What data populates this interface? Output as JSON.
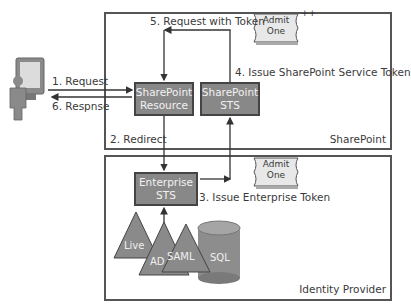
{
  "diagram": {
    "zones": {
      "sharepoint": "SharePoint",
      "identity_provider": "Identity Provider"
    },
    "nodes": {
      "sharepoint_resource": [
        "SharePoint",
        "Resource"
      ],
      "sharepoint_sts": [
        "SharePoint",
        "STS"
      ],
      "enterprise_sts": [
        "Enterprise",
        "STS"
      ]
    },
    "steps": {
      "request": "1. Request",
      "redirect": "2. Redirect",
      "issue_enterprise_token": "3. Issue Enterprise Token",
      "issue_sharepoint_token": "4. Issue SharePoint Service Token",
      "request_with_token": "5. Request with Token",
      "response": "6. Respnse"
    },
    "tokens": {
      "ticket_line1": "Admit",
      "ticket_line2": "One",
      "plus_mark": "++"
    },
    "identity_stores": {
      "live": "Live",
      "ad": "AD",
      "saml": "SAML",
      "sql": "SQL"
    },
    "colors": {
      "node_fill": "#888888",
      "node_border": "#444444",
      "line": "#333333",
      "zone_border": "#555555",
      "ticket_fill": "#e8e8e8"
    }
  }
}
